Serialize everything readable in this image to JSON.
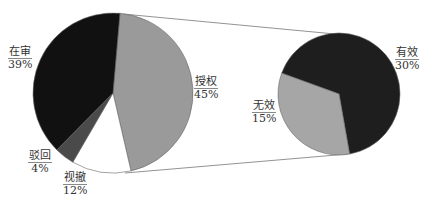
{
  "chart_data": {
    "type": "pie-of-pie",
    "title": "",
    "main_pie": {
      "slices": [
        {
          "label": "授权",
          "value": 45,
          "color": "#9a9a9a"
        },
        {
          "label": "视撤",
          "value": 12,
          "color": "#ffffff"
        },
        {
          "label": "驳回",
          "value": 4,
          "color": "#4a4a4a"
        },
        {
          "label": "在审",
          "value": 39,
          "color": "#111111"
        }
      ]
    },
    "secondary_pie": {
      "parent": "授权",
      "slices": [
        {
          "label": "有效",
          "value": 30,
          "color": "#1e1e1e"
        },
        {
          "label": "无效",
          "value": 15,
          "color": "#a6a6a6"
        }
      ]
    }
  },
  "labels": {
    "zaishen": {
      "name": "在审",
      "pct": "39%"
    },
    "shouquan": {
      "name": "授权",
      "pct": "45%"
    },
    "bohui": {
      "name": "驳回",
      "pct": "4%"
    },
    "shiche": {
      "name": "视撤",
      "pct": "12%"
    },
    "youxiao": {
      "name": "有效",
      "pct": "30%"
    },
    "wuxiao": {
      "name": "无效",
      "pct": "15%"
    }
  }
}
